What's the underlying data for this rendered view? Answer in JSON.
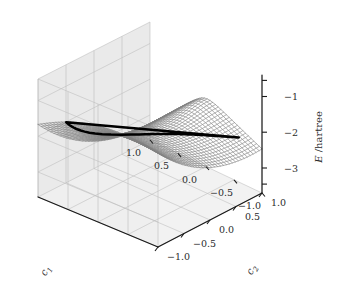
{
  "figure": {
    "kind": "3d-surface-wireframe-plot",
    "background_color": "#ffffff",
    "panel_color": "#f0f0f0",
    "panel_grid_color": "#b9b9b9",
    "mesh_color": "#7c7c7c",
    "contour_color": "#000000",
    "axis_color": "#1a1a1a",
    "text_color": "#2b2b2b"
  },
  "axes": {
    "x": {
      "name": "c1",
      "label_main": "c",
      "label_sub": "1",
      "ticks": [
        "1.0",
        "0.5",
        "0.0",
        "-0.5",
        "-1.0"
      ],
      "tick_values": [
        1.0,
        0.5,
        0.0,
        -0.5,
        -1.0
      ],
      "range": [
        -1.0,
        1.0
      ]
    },
    "y": {
      "name": "c2",
      "label_main": "c",
      "label_sub": "2",
      "ticks": [
        "-1.0",
        "-0.5",
        "0.0",
        "0.5",
        "1.0"
      ],
      "tick_values": [
        -1.0,
        -0.5,
        0.0,
        0.5,
        1.0
      ],
      "range": [
        -1.0,
        1.0
      ]
    },
    "z": {
      "name": "E",
      "label_main": "E",
      "label_unit": "/hartree",
      "ticks": [
        "-1",
        "-2",
        "-3"
      ],
      "tick_values": [
        -1,
        -2,
        -3
      ],
      "range": [
        -3.7,
        -0.4
      ]
    }
  },
  "chart_data": {
    "type": "surface",
    "title": "",
    "xlabel": "c1",
    "ylabel": "c2",
    "zlabel": "E /hartree",
    "grid": true,
    "legend": null,
    "xlim": [
      -1.0,
      1.0
    ],
    "ylim": [
      -1.0,
      1.0
    ],
    "zlim": [
      -3.7,
      -0.4
    ],
    "x_ticks": [
      1.0,
      0.5,
      0.0,
      -0.5,
      -1.0
    ],
    "y_ticks": [
      -1.0,
      -0.5,
      0.0,
      0.5,
      1.0
    ],
    "z_ticks": [
      -1,
      -2,
      -3
    ],
    "mesh_resolution": [
      40,
      40
    ],
    "surface_description": "Energy surface E(c1,c2) in hartree showing a broad saddle/trough: a deep valley running across the middle of the domain, a pinch point (conical intersection-like seam) near the left edge, upswept corners at the far left and far right, and a steep descent at the front of the domain.",
    "contour": {
      "style": "bold closed loop",
      "level": -2.0,
      "description": "Single bold black closed contour of constant energy encircling the central minimum basin and passing through the pinch point at left"
    },
    "sample_points": [
      {
        "c1": -1.0,
        "c2": -1.0,
        "E": -0.55
      },
      {
        "c1": -1.0,
        "c2": 0.0,
        "E": -1.4
      },
      {
        "c1": -1.0,
        "c2": 1.0,
        "E": -2.55
      },
      {
        "c1": 0.0,
        "c2": -1.0,
        "E": -1.05
      },
      {
        "c1": 0.0,
        "c2": 0.0,
        "E": -2.35
      },
      {
        "c1": 0.0,
        "c2": 1.0,
        "E": -3.3
      },
      {
        "c1": 1.0,
        "c2": -1.0,
        "E": -0.6
      },
      {
        "c1": 1.0,
        "c2": 0.0,
        "E": -1.95
      },
      {
        "c1": 1.0,
        "c2": 1.0,
        "E": -2.85
      }
    ]
  }
}
